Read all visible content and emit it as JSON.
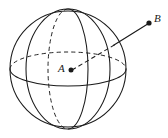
{
  "figure": {
    "type": "geometry-diagram",
    "background_color": "#ffffff",
    "stroke_color": "#1a1a1a",
    "labels": {
      "center_point": "A",
      "external_point": "B"
    },
    "points": [
      {
        "name": "A",
        "label": "A",
        "x": 71,
        "y": 70,
        "kind": "center-of-sphere",
        "marker": "filled-dot"
      },
      {
        "name": "B",
        "label": "B",
        "x": 149,
        "y": 23,
        "kind": "external-point",
        "marker": "filled-dot"
      }
    ],
    "sphere": {
      "center_x": 68,
      "center_y": 69,
      "radius": 58,
      "outline_style": "solid"
    },
    "equator": {
      "rx": 58,
      "ry": 17,
      "front_style": "solid",
      "back_style": "dashed"
    },
    "meridian_narrow": {
      "rx": 20,
      "ry": 60,
      "front_style": "solid",
      "back_style": "dashed"
    },
    "meridian_wide": {
      "rx": 42,
      "ry": 60,
      "front_style": "solid",
      "back_style": "solid"
    },
    "segment_ab": {
      "from": "A",
      "to": "B",
      "inside_style": "dashed",
      "outside_style": "solid"
    }
  }
}
